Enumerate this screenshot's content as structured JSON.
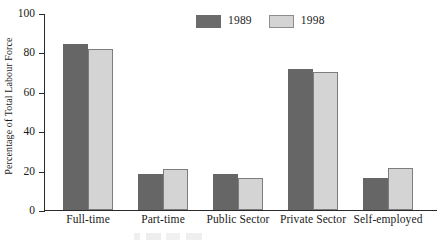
{
  "chart_data": {
    "type": "bar",
    "title": "",
    "xlabel": "",
    "ylabel": "Percentage of Total Labour Force",
    "ylim": [
      0,
      100
    ],
    "yticks": [
      0,
      20,
      40,
      60,
      80,
      100
    ],
    "grid": false,
    "legend_position": "top-center",
    "categories": [
      "Full-time",
      "Part-time",
      "Public Sector",
      "Private Sector",
      "Self-employed"
    ],
    "series": [
      {
        "name": "1989",
        "color": "#666666",
        "values": [
          84.5,
          18.5,
          18.5,
          72,
          16.5
        ]
      },
      {
        "name": "1998",
        "color": "#d4d4d4",
        "values": [
          82,
          21,
          16.5,
          70.5,
          21.5
        ]
      }
    ]
  },
  "axis": {
    "tick_labels": [
      "100",
      "80",
      "60",
      "40",
      "20",
      "0"
    ],
    "y_axis_title": "Percentage of Total Labour Force"
  },
  "legend": {
    "entries": [
      {
        "label": "1989",
        "swatch": "dark-gray-swatch"
      },
      {
        "label": "1998",
        "swatch": "light-gray-swatch"
      }
    ]
  }
}
